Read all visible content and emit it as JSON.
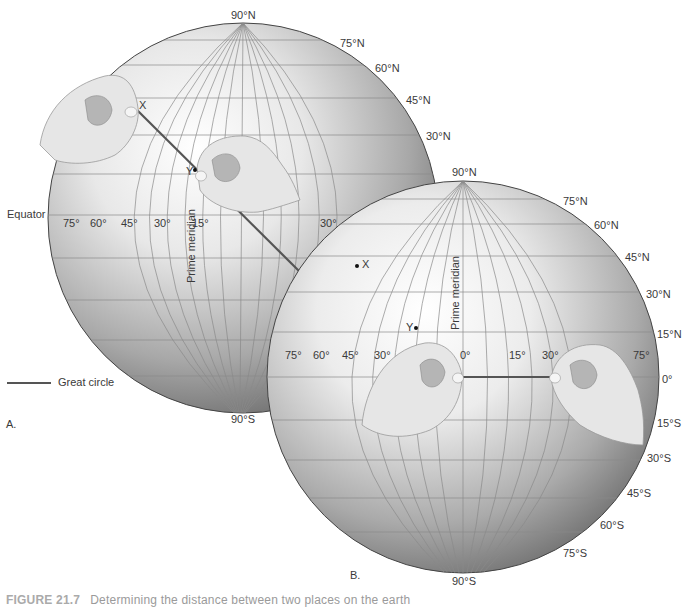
{
  "figure": {
    "caption_label": "FIGURE 21.7",
    "caption_text": "Determining the distance between two places on the earth"
  },
  "legend": {
    "great_circle_label": "Great circle",
    "line_color": "#555555"
  },
  "globe_a": {
    "panel_label": "A.",
    "north_pole": "90°N",
    "south_pole": "90°S",
    "latitudes": [
      "75°N",
      "60°N",
      "45°N",
      "30°N"
    ],
    "equator_label": "Equator",
    "longitudes": [
      "75°",
      "60°",
      "45°",
      "30°",
      "15°",
      "30°"
    ],
    "prime_meridian_label": "Prime   meridian",
    "point_x": "X",
    "point_y": "Y"
  },
  "globe_b": {
    "panel_label": "B.",
    "north_pole": "90°N",
    "south_pole": "90°S",
    "latitudes_north": [
      "75°N",
      "60°N",
      "45°N",
      "30°N",
      "15°N"
    ],
    "equator_label": "0°",
    "latitudes_south": [
      "15°S",
      "30°S",
      "45°S",
      "60°S",
      "75°S"
    ],
    "longitudes": [
      "75°",
      "60°",
      "45°",
      "30°",
      "0°",
      "15°",
      "30°",
      "75°"
    ],
    "prime_meridian_label": "Prime   meridian",
    "point_x": "X",
    "point_y": "Y"
  },
  "colors": {
    "globe_light": "#f4f4f4",
    "globe_dark": "#6a6a6a",
    "grid": "#8a8a8a",
    "hand": "#e2e2e2"
  }
}
